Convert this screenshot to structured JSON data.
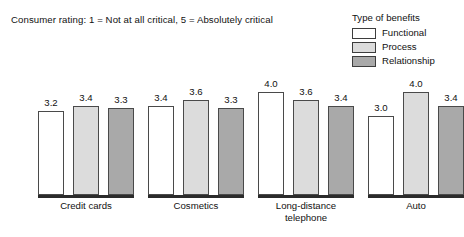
{
  "chart_data": {
    "type": "bar",
    "title": "Consumer rating: 1 = Not at all critical, 5 = Absolutely critical",
    "subtitle": "",
    "xlabel": "",
    "ylabel": "",
    "ylim": [
      0,
      5
    ],
    "grid": false,
    "legend_position": "top-right",
    "legend_title": "Type of benefits",
    "categories": [
      "Credit cards",
      "Cosmetics",
      "Long-distance telephone",
      "Auto"
    ],
    "series": [
      {
        "name": "Functional",
        "color": "#ffffff",
        "values": [
          3.2,
          3.4,
          4.0,
          3.0
        ]
      },
      {
        "name": "Process",
        "color": "#dcdcdc",
        "values": [
          3.4,
          3.6,
          3.6,
          4.0
        ]
      },
      {
        "name": "Relationship",
        "color": "#a9a9a9",
        "values": [
          3.3,
          3.3,
          3.4,
          3.4
        ]
      }
    ],
    "value_labels": [
      [
        "3.2",
        "3.4",
        "3.3"
      ],
      [
        "3.4",
        "3.6",
        "3.3"
      ],
      [
        "4.0",
        "3.6",
        "3.4"
      ],
      [
        "3.0",
        "4.0",
        "3.4"
      ]
    ]
  },
  "title": {
    "text": "Consumer rating: 1 = Not at all critical, 5 = Absolutely critical"
  },
  "legend": {
    "title": "Type of benefits",
    "items": [
      {
        "label": "Functional",
        "color": "#ffffff"
      },
      {
        "label": "Process",
        "color": "#dcdcdc"
      },
      {
        "label": "Relationship",
        "color": "#a9a9a9"
      }
    ]
  },
  "categories": [
    {
      "label": "Credit cards",
      "line1": "Credit cards",
      "line2": ""
    },
    {
      "label": "Cosmetics",
      "line1": "Cosmetics",
      "line2": ""
    },
    {
      "label": "Long-distance telephone",
      "line1": "Long-distance",
      "line2": "telephone"
    },
    {
      "label": "Auto",
      "line1": "Auto",
      "line2": ""
    }
  ],
  "colors": {
    "functional": "#ffffff",
    "process": "#dcdcdc",
    "relationship": "#a9a9a9",
    "outline": "#4a4a4a",
    "baseline": "#2b2b2b",
    "text": "#111111",
    "background": "#ffffff"
  }
}
